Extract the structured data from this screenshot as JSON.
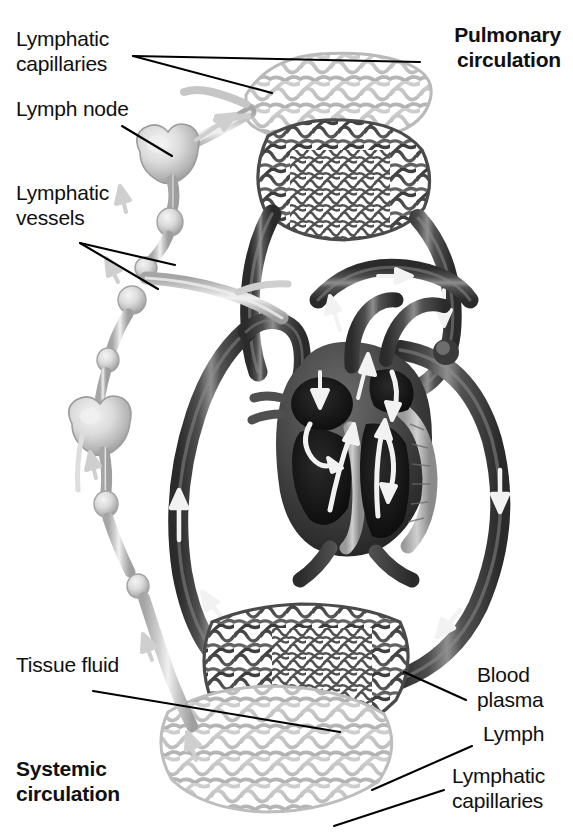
{
  "figure": {
    "width": 573,
    "height": 832,
    "background": "#ffffff"
  },
  "labels": {
    "lymphatic_capillaries_top": "Lymphatic\ncapillaries",
    "lymph_node": "Lymph node",
    "lymphatic_vessels": "Lymphatic\nvessels",
    "pulmonary_circulation": "Pulmonary\ncirculation",
    "tissue_fluid": "Tissue fluid",
    "systemic_circulation": "Systemic\ncirculation",
    "blood_plasma": "Blood\nplasma",
    "lymph": "Lymph",
    "lymphatic_capillaries_bottom": "Lymphatic\ncapillaries"
  },
  "colors": {
    "text": "#101010",
    "leader_line": "#000000",
    "blood_vessel_dark": "#4a4a4a",
    "blood_vessel_shadow": "#2b2b2b",
    "blood_vessel_highlight": "#8f8f8f",
    "lymph_vessel_light": "#c9c9c9",
    "lymph_vessel_shadow": "#a8a8a8",
    "lymph_vessel_highlight": "#ededed",
    "flow_arrow": "#f2f2f2",
    "lymph_flow_arrow": "#cfcfcf",
    "background": "#ffffff"
  },
  "structures": [
    {
      "name": "pulmonary-lymphatic-capillary-bed",
      "tone": "light",
      "region": "top-center"
    },
    {
      "name": "pulmonary-blood-capillary-bed",
      "tone": "dark",
      "region": "upper-center"
    },
    {
      "name": "heart",
      "tone": "dark",
      "region": "center"
    },
    {
      "name": "aorta",
      "tone": "dark",
      "region": "center-right"
    },
    {
      "name": "vena-cava",
      "tone": "dark",
      "region": "center-left"
    },
    {
      "name": "pulmonary-artery",
      "tone": "dark",
      "region": "upper-center"
    },
    {
      "name": "pulmonary-vein",
      "tone": "dark",
      "region": "upper-right"
    },
    {
      "name": "systemic-blood-capillary-bed",
      "tone": "dark",
      "region": "bottom-center"
    },
    {
      "name": "systemic-lymphatic-capillary-bed",
      "tone": "light",
      "region": "bottom-center"
    },
    {
      "name": "lymph-node-upper",
      "tone": "light",
      "region": "left"
    },
    {
      "name": "lymph-node-lower",
      "tone": "light",
      "region": "left"
    },
    {
      "name": "lymphatic-vessel-chain",
      "tone": "light",
      "region": "left"
    },
    {
      "name": "thoracic-duct-junction",
      "tone": "light",
      "region": "center-left"
    }
  ],
  "flow_arrows": [
    {
      "name": "pulmonary-artery-flow",
      "direction": "up"
    },
    {
      "name": "pulmonary-vein-flow",
      "direction": "down"
    },
    {
      "name": "aorta-descending-flow",
      "direction": "down"
    },
    {
      "name": "vena-cava-ascending-flow",
      "direction": "up"
    },
    {
      "name": "right-atrium-inflow",
      "direction": "down"
    },
    {
      "name": "right-ventricle-outflow",
      "direction": "up"
    },
    {
      "name": "left-atrium-inflow",
      "direction": "down"
    },
    {
      "name": "left-ventricle-outflow",
      "direction": "up"
    },
    {
      "name": "lymph-flow-upper",
      "direction": "up"
    },
    {
      "name": "lymph-flow-lower",
      "direction": "up"
    }
  ]
}
